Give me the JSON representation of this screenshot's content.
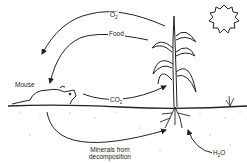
{
  "diagram": {
    "labels": {
      "o2": "O",
      "o2_sub": "2",
      "food": "Food",
      "mouse": "Mouse",
      "co2": "CO",
      "co2_sub": "2",
      "minerals_line1": "Minerals from",
      "minerals_line2": "decomposition",
      "h2o_h": "H",
      "h2o_sub": "2",
      "h2o_o": "O"
    },
    "nodes": [
      "Sun",
      "Plant (corn)",
      "Mouse",
      "Soil",
      "Small plant"
    ],
    "edges": [
      {
        "from": "Plant (corn)",
        "to": "Mouse",
        "label": "O2"
      },
      {
        "from": "Plant (corn)",
        "to": "Mouse",
        "label": "Food"
      },
      {
        "from": "Mouse",
        "to": "Plant (corn)",
        "label": "CO2"
      },
      {
        "from": "Mouse",
        "to": "Plant (corn)",
        "label": "Minerals from decomposition"
      },
      {
        "from": "Soil",
        "to": "Plant (corn)",
        "label": "H2O"
      }
    ],
    "colors": {
      "line": "#222222",
      "soil_dots": "#9a9a9a",
      "background": "#ffffff"
    }
  }
}
